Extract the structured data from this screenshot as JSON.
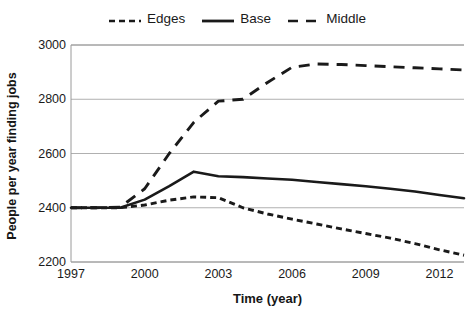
{
  "chart_data": {
    "type": "line",
    "title": "",
    "xlabel": "Time (year)",
    "ylabel": "People per year finding jobs",
    "xlim": [
      1997,
      2013
    ],
    "ylim": [
      2200,
      3000
    ],
    "xticks": [
      1997,
      2000,
      2003,
      2006,
      2009,
      2012
    ],
    "yticks": [
      2200,
      2400,
      2600,
      2800,
      3000
    ],
    "grid": "horizontal",
    "legend_position": "top-center",
    "x": [
      1997,
      1998,
      1999,
      2000,
      2001,
      2002,
      2003,
      2004,
      2005,
      2006,
      2007,
      2008,
      2009,
      2010,
      2011,
      2012,
      2013
    ],
    "series": [
      {
        "name": "Edges",
        "style": "short-dash",
        "color": "#1a1a1a",
        "values": [
          2400,
          2400,
          2400,
          2410,
          2428,
          2440,
          2437,
          2400,
          2377,
          2358,
          2340,
          2322,
          2305,
          2288,
          2268,
          2245,
          2225
        ]
      },
      {
        "name": "Base",
        "style": "solid",
        "color": "#1a1a1a",
        "values": [
          2400,
          2400,
          2400,
          2430,
          2480,
          2533,
          2516,
          2513,
          2508,
          2503,
          2495,
          2487,
          2479,
          2470,
          2460,
          2447,
          2435
        ]
      },
      {
        "name": "Middle",
        "style": "long-dash",
        "color": "#1a1a1a",
        "values": [
          2400,
          2400,
          2402,
          2470,
          2600,
          2715,
          2793,
          2800,
          2862,
          2918,
          2930,
          2928,
          2924,
          2920,
          2916,
          2912,
          2908
        ]
      }
    ]
  },
  "legend": {
    "entries": [
      {
        "label": "Edges",
        "icon": "short-dash-line-swatch"
      },
      {
        "label": "Base",
        "icon": "solid-line-swatch"
      },
      {
        "label": "Middle",
        "icon": "long-dash-line-swatch"
      }
    ]
  },
  "axes": {
    "y_title": "People per year finding jobs",
    "x_title": "Time (year)",
    "y_tick_labels": [
      "3000",
      "2800",
      "2600",
      "2400",
      "2200"
    ],
    "x_tick_labels": [
      "1997",
      "2000",
      "2003",
      "2006",
      "2009",
      "2012"
    ]
  },
  "colors": {
    "line": "#1a1a1a",
    "grid": "#b0b0b0",
    "axis": "#9a9a9a",
    "background": "#ffffff"
  }
}
